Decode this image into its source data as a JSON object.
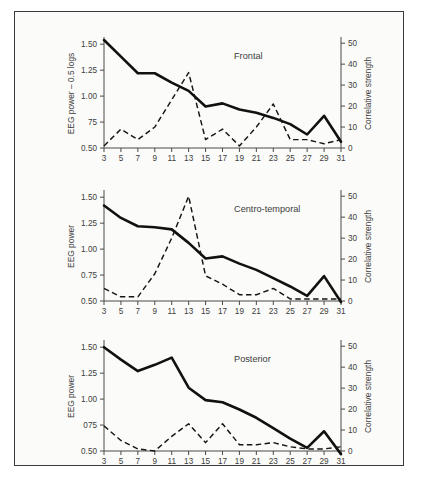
{
  "figure": {
    "background_color": "#fbfbf9",
    "border_color": "#3a3a3a",
    "series_solid_color": "#111111",
    "series_dashed_color": "#151515"
  },
  "chart_data": [
    {
      "type": "line",
      "title": "Frontal",
      "xlabel": "Frequencies",
      "ylabel": "EEG power – 0.5 logs",
      "y2label": "Correlative strength",
      "x": [
        3,
        5,
        7,
        9,
        11,
        13,
        15,
        17,
        19,
        21,
        23,
        25,
        27,
        29,
        31
      ],
      "xticklabels": [
        "3",
        "5",
        "7",
        "9",
        "11",
        "13",
        "15",
        "17",
        "19",
        "21",
        "23",
        "25",
        "27",
        "29",
        "31"
      ],
      "yticklabels": [
        "1.50",
        "1.25",
        "1.00",
        "75",
        "0.50"
      ],
      "ytickvalues": [
        1.5,
        1.25,
        1.0,
        0.75,
        0.5
      ],
      "ylim": [
        0.5,
        1.55
      ],
      "y2ticklabels": [
        "50",
        "40",
        "30",
        "20",
        "10",
        "0"
      ],
      "y2tickvalues": [
        50,
        40,
        30,
        20,
        10,
        0
      ],
      "y2lim": [
        0,
        52
      ],
      "grid": false,
      "legend": "none",
      "series": [
        {
          "name": "EEG power",
          "style": "solid",
          "axis": "left",
          "values": [
            1.54,
            1.38,
            1.22,
            1.22,
            1.13,
            1.05,
            0.9,
            0.93,
            0.87,
            0.84,
            0.79,
            0.73,
            0.63,
            0.81,
            0.56
          ]
        },
        {
          "name": "Correlative strength",
          "style": "dashed",
          "axis": "right",
          "values": [
            1,
            9,
            4,
            10,
            23,
            36,
            4,
            9,
            1,
            10,
            21,
            4,
            4,
            2,
            4
          ]
        }
      ]
    },
    {
      "type": "line",
      "title": "Centro-temporal",
      "xlabel": "Frequencies",
      "ylabel": "EEG power",
      "y2label": "Correlative strength",
      "x": [
        3,
        5,
        7,
        9,
        11,
        13,
        15,
        17,
        19,
        21,
        23,
        25,
        27,
        29,
        31
      ],
      "xticklabels": [
        "3",
        "5",
        "7",
        "9",
        "11",
        "13",
        "15",
        "17",
        "19",
        "21",
        "23",
        "25",
        "27",
        "29",
        "31"
      ],
      "yticklabels": [
        "1.50",
        "1.25",
        "1.00",
        "0.75",
        "0.50"
      ],
      "ytickvalues": [
        1.5,
        1.25,
        1.0,
        0.75,
        0.5
      ],
      "ylim": [
        0.5,
        1.55
      ],
      "y2ticklabels": [
        "50",
        "40",
        "30",
        "20",
        "10",
        "0"
      ],
      "y2tickvalues": [
        50,
        40,
        30,
        20,
        10,
        0
      ],
      "y2lim": [
        0,
        52
      ],
      "grid": false,
      "legend": "none",
      "series": [
        {
          "name": "EEG power",
          "style": "solid",
          "axis": "left",
          "values": [
            1.42,
            1.3,
            1.22,
            1.21,
            1.19,
            1.06,
            0.91,
            0.93,
            0.86,
            0.8,
            0.72,
            0.64,
            0.55,
            0.74,
            0.49
          ]
        },
        {
          "name": "Correlative strength",
          "style": "dashed",
          "axis": "right",
          "values": [
            6,
            2,
            2,
            13,
            30,
            50,
            12,
            8,
            3,
            3,
            6,
            1,
            1,
            1,
            1
          ]
        }
      ]
    },
    {
      "type": "line",
      "title": "Posterior",
      "xlabel": "Frequencies",
      "ylabel": "EEG power",
      "y2label": "Correlative strength",
      "x": [
        3,
        5,
        7,
        9,
        11,
        13,
        15,
        17,
        19,
        21,
        23,
        25,
        27,
        29,
        31
      ],
      "xticklabels": [
        "3",
        "5",
        "7",
        "9",
        "11",
        "13",
        "15",
        "17",
        "19",
        "21",
        "23",
        "25",
        "27",
        "29",
        "31"
      ],
      "yticklabels": [
        "1.50",
        "1.25",
        "1.00",
        "075",
        "0.50"
      ],
      "ytickvalues": [
        1.5,
        1.25,
        1.0,
        0.75,
        0.5
      ],
      "ylim": [
        0.5,
        1.55
      ],
      "y2ticklabels": [
        "50",
        "40",
        "30",
        "20",
        "10",
        "0"
      ],
      "y2tickvalues": [
        50,
        40,
        30,
        20,
        10,
        0
      ],
      "y2lim": [
        0,
        52
      ],
      "grid": false,
      "legend": "none",
      "series": [
        {
          "name": "EEG power",
          "style": "solid",
          "axis": "left",
          "values": [
            1.5,
            1.38,
            1.27,
            1.33,
            1.4,
            1.11,
            0.99,
            0.97,
            0.9,
            0.82,
            0.72,
            0.62,
            0.53,
            0.69,
            0.47
          ]
        },
        {
          "name": "Correlative strength",
          "style": "dashed",
          "axis": "right",
          "values": [
            12,
            5,
            1,
            0,
            7,
            13,
            4,
            13,
            3,
            3,
            4,
            2,
            1,
            1,
            2
          ]
        }
      ]
    }
  ]
}
